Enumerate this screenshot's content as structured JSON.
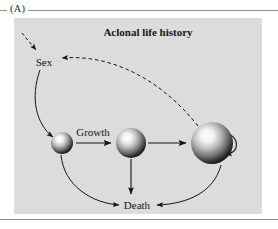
{
  "figure": {
    "panel_letter": "(A)",
    "title": "Aclonal life history",
    "panel_bg": "#dcdcdc",
    "page_bg": "#ffffff",
    "rule_color": "#8e8e8e",
    "ink_color": "#151515"
  },
  "nodes": [
    {
      "id": "sex",
      "label": "Sex",
      "type": "text-node",
      "x": 44,
      "y": 62
    },
    {
      "id": "death",
      "label": "Death",
      "type": "text-node",
      "x": 135,
      "y": 206
    },
    {
      "id": "stage-small",
      "label": "",
      "type": "sphere",
      "x": 62,
      "y": 143,
      "r": 11
    },
    {
      "id": "stage-medium",
      "label": "",
      "type": "sphere",
      "x": 131,
      "y": 143,
      "r": 15
    },
    {
      "id": "stage-large",
      "label": "",
      "type": "sphere",
      "x": 212,
      "y": 143,
      "r": 21
    }
  ],
  "edges": [
    {
      "id": "sex-to-small",
      "label": "",
      "style": "solid",
      "from": "sex",
      "to": "stage-small"
    },
    {
      "id": "small-to-medium",
      "label": "Growth",
      "style": "solid",
      "from": "stage-small",
      "to": "stage-medium"
    },
    {
      "id": "medium-to-large",
      "label": "",
      "style": "solid",
      "from": "stage-medium",
      "to": "stage-large"
    },
    {
      "id": "large-self-loop",
      "label": "",
      "style": "solid",
      "from": "stage-large",
      "to": "stage-large"
    },
    {
      "id": "large-to-sex",
      "label": "",
      "style": "dashed",
      "from": "stage-large",
      "to": "sex"
    },
    {
      "id": "external-to-sex",
      "label": "",
      "style": "dashed",
      "from": "",
      "to": "sex"
    },
    {
      "id": "small-to-death",
      "label": "",
      "style": "solid",
      "from": "stage-small",
      "to": "death"
    },
    {
      "id": "medium-to-death",
      "label": "",
      "style": "solid",
      "from": "stage-medium",
      "to": "death"
    },
    {
      "id": "large-to-death",
      "label": "",
      "style": "solid",
      "from": "stage-large",
      "to": "death"
    }
  ],
  "labels": {
    "growth": "Growth",
    "sex": "Sex",
    "death": "Death"
  }
}
